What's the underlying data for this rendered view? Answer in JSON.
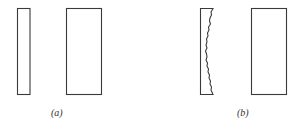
{
  "figure": {
    "panels": [
      {
        "id": "a",
        "label": "(a)",
        "description": "Two plain rectangles: a narrow bar and a wider block"
      },
      {
        "id": "b",
        "label": "(b)",
        "description": "Narrow bar with a rough, jagged right edge beside a wider block"
      }
    ],
    "colors": {
      "stroke": "#3a3a3a",
      "background": "#ffffff"
    }
  }
}
